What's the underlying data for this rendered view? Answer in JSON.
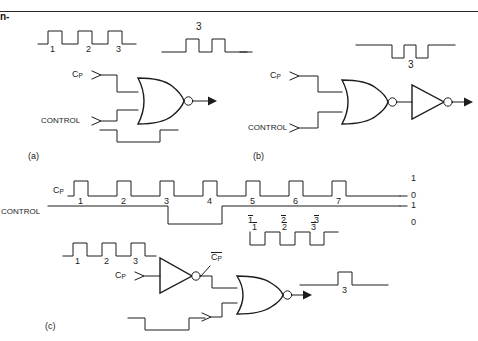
{
  "figure": {
    "title_rule": "horizontal-rule",
    "corner_fragment": "n-",
    "panels": [
      {
        "id": "a",
        "caption": "(a)",
        "gate": "NOR",
        "inputs": [
          {
            "name": "CP",
            "label": "C",
            "sub": "P"
          },
          {
            "name": "CONTROL",
            "label": "CONTROL",
            "sub": ""
          }
        ],
        "input_clock_pulse_labels": [
          "1",
          "2",
          "3"
        ],
        "output_waveform_label": "3",
        "output_waveform_pulses": 2,
        "output_polarity": "active-high"
      },
      {
        "id": "b",
        "caption": "(b)",
        "gate": "NOR",
        "extra_gate": "INVERTER",
        "inputs": [
          {
            "name": "CP",
            "label": "C",
            "sub": "P"
          },
          {
            "name": "CONTROL",
            "label": "CONTROL",
            "sub": ""
          }
        ],
        "output_waveform_label": "3",
        "output_waveform_pulses": 2,
        "output_polarity": "active-low"
      },
      {
        "id": "c",
        "caption": "(c)",
        "gate": "NOR",
        "extra_gate": "INVERTER",
        "inputs": [
          {
            "name": "CP",
            "label": "C",
            "sub": "P"
          }
        ],
        "input_clock_pulse_labels": [
          "1",
          "2",
          "3"
        ],
        "inverted_clock_label": "C",
        "inverted_clock_sub": "P",
        "inverted_clock_pulse_labels": [
          "1",
          "2",
          "3"
        ],
        "output_waveform_label": "3",
        "output_waveform_pulses": 1
      }
    ],
    "timing": {
      "row_cp_label": "C",
      "row_cp_sub": "P",
      "row_control_label": "CONTROL",
      "clock_pulse_numbers": [
        "1",
        "2",
        "3",
        "4",
        "5",
        "6",
        "7"
      ],
      "level_labels_cp": [
        "1",
        "0"
      ],
      "level_labels_control": [
        "1",
        "0"
      ],
      "gated_pulse_numbers": [
        "1",
        "2",
        "3"
      ]
    },
    "colors": {
      "ink": "#1c1c1c",
      "background": "#ffffff",
      "rule": "#2a2a2a"
    }
  }
}
